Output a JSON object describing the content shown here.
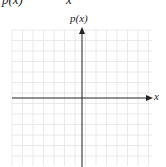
{
  "header_fragment": {
    "left_text": "p(x)",
    "right_text": "x"
  },
  "chart_data": {
    "type": "line",
    "title": "",
    "xlabel": "x",
    "ylabel": "p(x)",
    "series": [],
    "grid": true,
    "grid_cells": {
      "x": 13,
      "y": 13
    },
    "axes": {
      "x_axis": {
        "arrow": "right",
        "tick_labels": []
      },
      "y_axis": {
        "arrow": "up",
        "tick_labels": []
      }
    },
    "colors": {
      "axis": "#222222",
      "grid": "#e4e4e4"
    },
    "legend": null
  }
}
